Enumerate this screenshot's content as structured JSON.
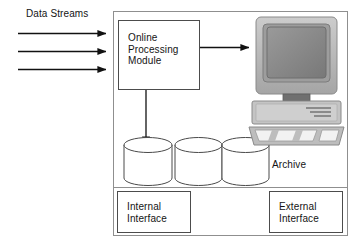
{
  "diagram": {
    "title_label": "Data Streams",
    "outer_container_name": "system-boundary",
    "module": {
      "label": "Online\nProcessing\nModule"
    },
    "archive": {
      "label": "Archive",
      "store_count": 3,
      "store_names": [
        "archive-store-1",
        "archive-store-2",
        "archive-store-3"
      ]
    },
    "interfaces": [
      {
        "label": "Internal\nInterface",
        "name": "internal-interface"
      },
      {
        "label": "External\nInterface",
        "name": "external-interface"
      }
    ],
    "workstation": {
      "name": "computer-workstation",
      "parts": [
        "monitor",
        "system-unit",
        "keyboard"
      ]
    },
    "flows": [
      {
        "name": "data-stream-arrow-1",
        "direction": "right"
      },
      {
        "name": "data-stream-arrow-2",
        "direction": "right"
      },
      {
        "name": "data-stream-arrow-3",
        "direction": "right"
      },
      {
        "name": "module-to-workstation-arrow",
        "direction": "right"
      },
      {
        "name": "module-to-archive-arrow",
        "direction": "down"
      }
    ],
    "colors": {
      "line": "#1a1a1a",
      "frame": "#8f8f8f",
      "box_border": "#4c4c4c",
      "monitor_body": "#b4b4b4",
      "monitor_screen": "#8c8c8c",
      "background": "#ffffff"
    }
  }
}
